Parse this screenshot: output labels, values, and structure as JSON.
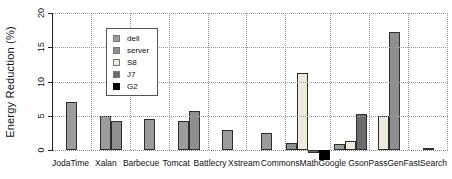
{
  "chart_data": {
    "type": "bar",
    "title": "",
    "xlabel": "",
    "ylabel": "Energy Reduction (%)",
    "ylim": [
      0,
      20
    ],
    "yticks": [
      0,
      5,
      10,
      15,
      20
    ],
    "grid": "dotted horizontal and vertical gridlines, grey",
    "legend_position": "top-left inside plot",
    "series_colors": {
      "dell": "#9c9c9c",
      "server": "#8f8f8f",
      "S8": "#eeebdd",
      "J7": "#6b6b6b",
      "G2": "#000000"
    },
    "legend": [
      {
        "label": "dell",
        "series": "dell"
      },
      {
        "label": "server",
        "series": "server"
      },
      {
        "label": "S8",
        "series": "S8"
      },
      {
        "label": "J7",
        "series": "J7"
      },
      {
        "label": "G2",
        "series": "G2"
      }
    ],
    "categories": [
      "JodaTime",
      "Xalan",
      "Barbecue",
      "Tomcat",
      "Battlecry",
      "Xstream",
      "CommonsMath",
      "Google Gson",
      "PassGen",
      "FastSearch"
    ],
    "bars_by_category": [
      {
        "category": "JodaTime",
        "bars": [
          {
            "series": "dell",
            "value": 7.0
          }
        ]
      },
      {
        "category": "Xalan",
        "bars": [
          {
            "series": "dell",
            "value": 5.0
          },
          {
            "series": "server",
            "value": 4.3
          }
        ]
      },
      {
        "category": "Barbecue",
        "bars": [
          {
            "series": "dell",
            "value": 4.5
          }
        ]
      },
      {
        "category": "Tomcat",
        "bars": [
          {
            "series": "dell",
            "value": 4.2
          },
          {
            "series": "server",
            "value": 5.7
          }
        ]
      },
      {
        "category": "Battlecry",
        "bars": [
          {
            "series": "dell",
            "value": 2.9
          }
        ]
      },
      {
        "category": "Xstream",
        "bars": [
          {
            "series": "dell",
            "value": 2.5
          }
        ]
      },
      {
        "category": "CommonsMath",
        "bars": [
          {
            "series": "server",
            "value": 1.0
          },
          {
            "series": "S8",
            "value": 11.2
          },
          {
            "series": "J7",
            "value": -0.5
          },
          {
            "series": "G2",
            "value": -1.5
          }
        ]
      },
      {
        "category": "Google Gson",
        "bars": [
          {
            "series": "dell",
            "value": 0.9
          },
          {
            "series": "S8",
            "value": 1.3
          },
          {
            "series": "J7",
            "value": 5.2
          }
        ]
      },
      {
        "category": "PassGen",
        "bars": [
          {
            "series": "S8",
            "value": 4.9
          },
          {
            "series": "server",
            "value": 17.3
          }
        ]
      },
      {
        "category": "FastSearch",
        "bars": [
          {
            "series": "J7",
            "value": 0.2
          }
        ]
      }
    ]
  }
}
